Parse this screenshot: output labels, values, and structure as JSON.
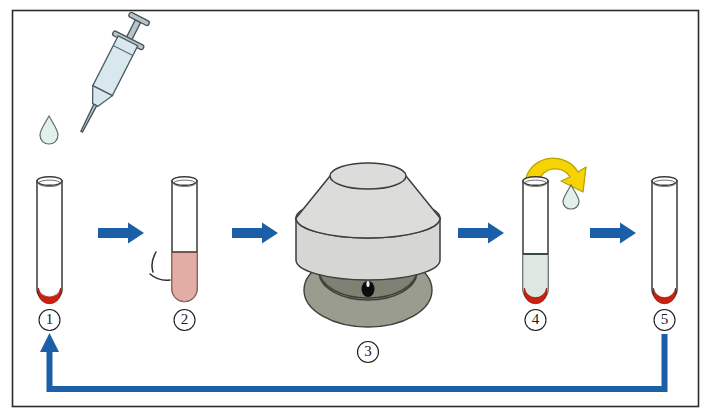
{
  "figure": {
    "frame": {
      "border_color": "#2b2b2b",
      "background": "#ffffff"
    }
  },
  "colors": {
    "arrow_blue": "#1b5fa8",
    "recycle_blue": "#1b5fa8",
    "pellet_red": "#cc2010",
    "suspension_pink": "#e2ada4",
    "supernatant": "#dde8e3",
    "yellow_arrow": "#f6d404",
    "yellow_arrow_outline": "#b9a300",
    "centrifuge_body": "#d6d6d4",
    "centrifuge_base": "#9b9c90",
    "glass_outline": "#3a3a3a",
    "syringe_glass": "#d8e8ee"
  },
  "steps": [
    {
      "id": "step-1",
      "label": "1",
      "name": "test-tube-with-pellet",
      "description": "Test tube containing a small red cell pellet",
      "contents": [
        {
          "layer": "pellet",
          "color": "#cc2010",
          "fill_fraction": 0.08
        }
      ]
    },
    {
      "id": "step-2",
      "label": "2",
      "name": "test-tube-resuspended",
      "description": "Tube filled with pink resuspended cell suspension, being mixed",
      "contents": [
        {
          "layer": "suspension",
          "color": "#e2ada4",
          "fill_fraction": 0.45
        }
      ]
    },
    {
      "id": "step-3",
      "label": "3",
      "name": "centrifuge",
      "description": "Benchtop centrifuge with closed lid spinning the sample"
    },
    {
      "id": "step-4",
      "label": "4",
      "name": "test-tube-after-spin",
      "description": "Tube after centrifugation: clear supernatant above red pellet; supernatant poured off",
      "contents": [
        {
          "layer": "supernatant",
          "color": "#dde8e3",
          "fill_fraction": 0.33
        },
        {
          "layer": "pellet",
          "color": "#cc2010",
          "fill_fraction": 0.08
        }
      ]
    },
    {
      "id": "step-5",
      "label": "5",
      "name": "test-tube-washed-pellet",
      "description": "Tube with washed red pellet only, ready for the next wash cycle",
      "contents": [
        {
          "layer": "pellet",
          "color": "#cc2010",
          "fill_fraction": 0.08
        }
      ]
    }
  ],
  "annotations": {
    "syringe": {
      "name": "syringe-dispensing-buffer",
      "description": "Syringe tilted above tube 1, dispensing a drop of saline"
    },
    "drop_from_syringe": {
      "name": "liquid-droplet",
      "description": "Droplet falling from the syringe needle"
    },
    "mixing_lines": {
      "name": "vibration-lines",
      "description": "Two curved motion lines indicating the tube is being agitated"
    },
    "decant_arrow": {
      "name": "decant-curved-arrow",
      "description": "Yellow curved arrow showing the supernatant being poured off"
    },
    "drop_decanted": {
      "name": "decanted-droplet",
      "description": "Droplet of discarded supernatant"
    },
    "recycle_arrow": {
      "name": "repeat-cycle-arrow",
      "description": "Blue arrow returning from step 5 back to step 1, indicating the wash is repeated"
    },
    "flow_arrows": {
      "name": "process-flow-arrow",
      "count": 4,
      "description": "Blue right-pointing arrows connecting consecutive steps"
    }
  }
}
